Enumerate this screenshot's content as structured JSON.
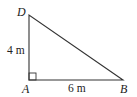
{
  "diagram": {
    "type": "right-triangle",
    "vertices": [
      {
        "id": "D",
        "label": "D",
        "x": 29,
        "y": 15
      },
      {
        "id": "A",
        "label": "A",
        "x": 29,
        "y": 80
      },
      {
        "id": "B",
        "label": "B",
        "x": 123,
        "y": 80
      }
    ],
    "right_angle_at": "A",
    "sides": [
      {
        "from": "D",
        "to": "A",
        "length_label": "4 m"
      },
      {
        "from": "A",
        "to": "B",
        "length_label": "6 m"
      },
      {
        "from": "D",
        "to": "B",
        "length_label": ""
      }
    ],
    "stroke_color": "#333333"
  }
}
